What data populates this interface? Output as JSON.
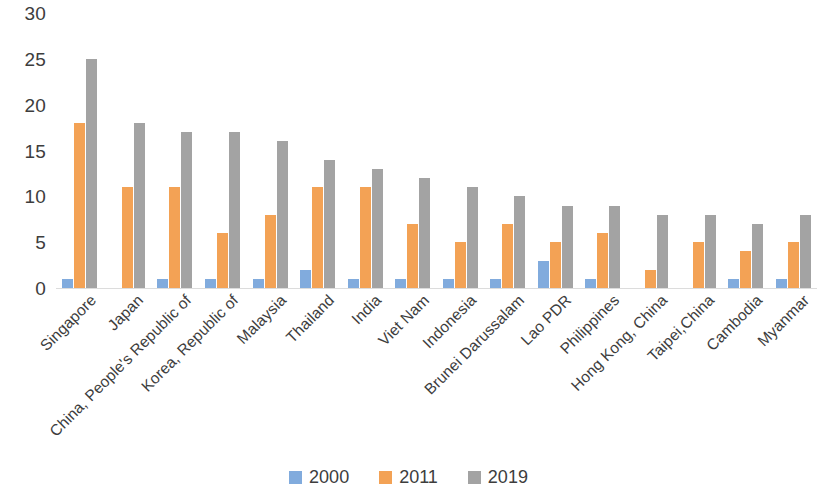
{
  "chart_data": {
    "type": "bar",
    "title": "",
    "subtitle": "",
    "xlabel": "",
    "ylabel": "",
    "ylim": [
      0,
      30
    ],
    "yticks": [
      0,
      5,
      10,
      15,
      20,
      25,
      30
    ],
    "ytick_labels": [
      "0",
      "5",
      "10",
      "15",
      "20",
      "25",
      "30"
    ],
    "grid": false,
    "legend_position": "bottom-center",
    "orientation": "vertical",
    "grouping": "grouped",
    "categories": [
      "Singapore",
      "Japan",
      "China, People's Republic of",
      "Korea, Republic of",
      "Malaysia",
      "Thailand",
      "India",
      "Viet Nam",
      "Indonesia",
      "Brunei Darussalam",
      "Lao PDR",
      "Philippines",
      "Hong Kong, China",
      "Taipei,China",
      "Cambodia",
      "Myanmar"
    ],
    "series": [
      {
        "name": "2000",
        "color": "#81abdd",
        "values": [
          1,
          0,
          1,
          1,
          1,
          2,
          1,
          1,
          1,
          1,
          3,
          1,
          0,
          0,
          1,
          1
        ]
      },
      {
        "name": "2011",
        "color": "#f3a255",
        "values": [
          18,
          11,
          11,
          6,
          8,
          11,
          11,
          7,
          5,
          7,
          5,
          6,
          2,
          5,
          4,
          5
        ]
      },
      {
        "name": "2019",
        "color": "#a3a3a3",
        "values": [
          25,
          18,
          17,
          17,
          16,
          14,
          13,
          12,
          11,
          10,
          9,
          9,
          8,
          8,
          7,
          8
        ]
      }
    ]
  },
  "legend": {
    "items": [
      {
        "label": "2000",
        "color": "#81abdd"
      },
      {
        "label": "2011",
        "color": "#f3a255"
      },
      {
        "label": "2019",
        "color": "#a3a3a3"
      }
    ]
  }
}
